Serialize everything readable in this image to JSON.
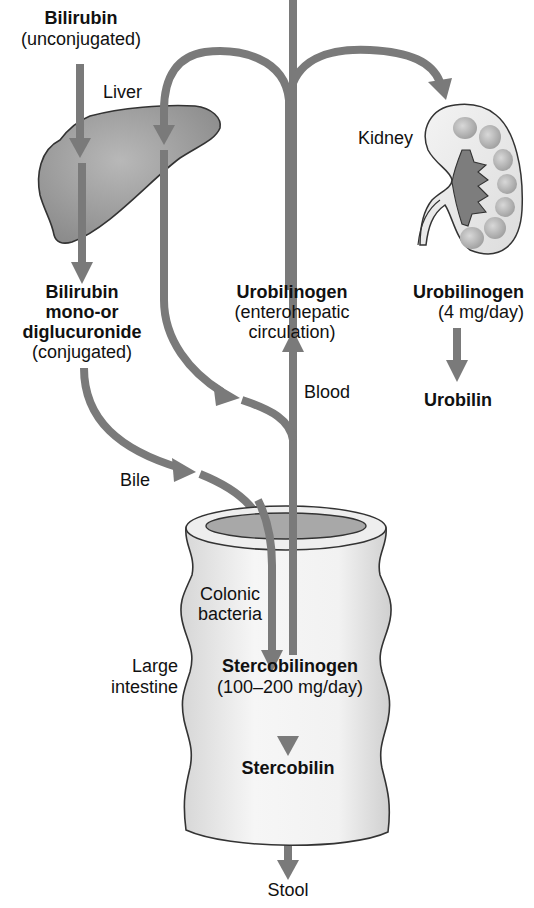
{
  "colors": {
    "arrow": "#7a7a7a",
    "organ_fill_dark": "#9a9a9a",
    "organ_fill_light": "#e9e9e9",
    "outline": "#333333",
    "text": "#111111"
  },
  "labels": {
    "bilirubin_unconj_title": "Bilirubin",
    "bilirubin_unconj_sub": "(unconjugated)",
    "liver": "Liver",
    "kidney": "Kidney",
    "bilirubin_conj_line1": "Bilirubin",
    "bilirubin_conj_line2": "mono-or",
    "bilirubin_conj_line3": "diglucuronide",
    "bilirubin_conj_sub": "(conjugated)",
    "urobilinogen_ehc_title": "Urobilinogen",
    "urobilinogen_ehc_sub1": "(enterohepatic",
    "urobilinogen_ehc_sub2": "circulation)",
    "urobilinogen_kidney_title": "Urobilinogen",
    "urobilinogen_kidney_sub": "(4 mg/day)",
    "urobilin": "Urobilin",
    "blood": "Blood",
    "bile": "Bile",
    "colonic_bacteria_1": "Colonic",
    "colonic_bacteria_2": "bacteria",
    "large_intestine_1": "Large",
    "large_intestine_2": "intestine",
    "stercobilinogen_title": "Stercobilinogen",
    "stercobilinogen_sub": "(100–200 mg/day)",
    "stercobilin": "Stercobilin",
    "stool": "Stool"
  }
}
